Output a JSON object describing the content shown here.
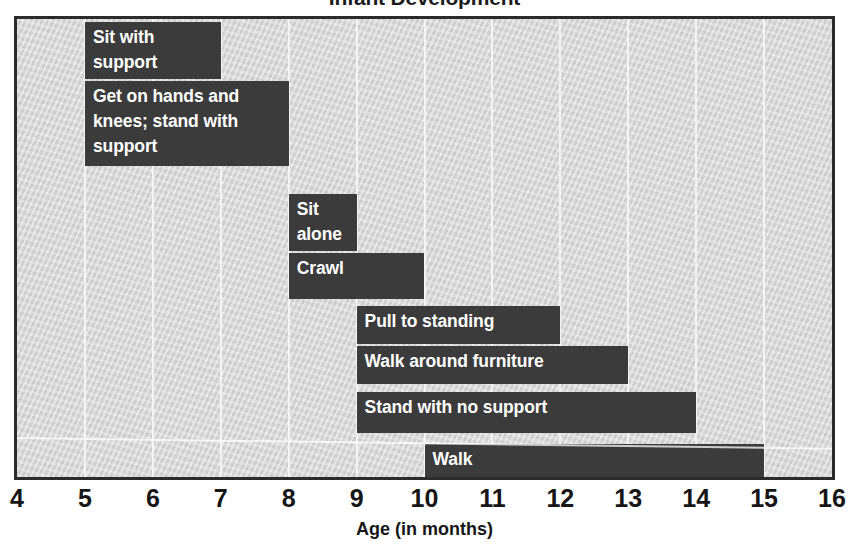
{
  "chart_data": {
    "type": "bar",
    "orientation": "horizontal",
    "subtype": "gantt-range",
    "title": "Infant Development",
    "xlabel": "Age (in months)",
    "ylabel": "",
    "xlim": [
      4,
      16
    ],
    "xticks": [
      4,
      5,
      6,
      7,
      8,
      9,
      10,
      11,
      12,
      13,
      14,
      15,
      16
    ],
    "xtick_labels": [
      "4",
      "5",
      "6",
      "7",
      "8",
      "9",
      "10",
      "11",
      "12",
      "13",
      "14",
      "15",
      "16"
    ],
    "grid": true,
    "grid_axis": "x",
    "legend": false,
    "categories": [
      "Sit with support",
      "Get on hands and knees; stand with support",
      "Sit alone",
      "Crawl",
      "Pull to standing",
      "Walk around furniture",
      "Stand with no support",
      "Walk"
    ],
    "bars": [
      {
        "label": "Sit with\nsupport",
        "label_plain": "Sit with support",
        "start": 5,
        "end": 7,
        "row": 0
      },
      {
        "label": "Get on hands and\nknees; stand with\nsupport",
        "label_plain": "Get on hands and knees; stand with support",
        "start": 5,
        "end": 8,
        "row": 1
      },
      {
        "label": "Sit\nalone",
        "label_plain": "Sit alone",
        "start": 8,
        "end": 9,
        "row": 2
      },
      {
        "label": "Crawl",
        "label_plain": "Crawl",
        "start": 8,
        "end": 10,
        "row": 3
      },
      {
        "label": "Pull to standing",
        "label_plain": "Pull to standing",
        "start": 9,
        "end": 12,
        "row": 4
      },
      {
        "label": "Walk around furniture",
        "label_plain": "Walk around furniture",
        "start": 9,
        "end": 13,
        "row": 5
      },
      {
        "label": "Stand with no support",
        "label_plain": "Stand with no support",
        "start": 9,
        "end": 14,
        "row": 6
      },
      {
        "label": "Walk",
        "label_plain": "Walk",
        "start": 10,
        "end": 15,
        "row": 7
      }
    ],
    "colors": {
      "bar": "#3b3b3b",
      "bar_text": "#ffffff",
      "plot_background": "#d5d5d5",
      "gridline": "#f4f4f4",
      "frame": "#2b2b2b",
      "axis_text": "#161616",
      "page_background": "#ffffff"
    }
  },
  "layout": {
    "plot": {
      "left": 14,
      "top": 16,
      "width": 821,
      "height": 464,
      "border": 3
    },
    "rows": [
      {
        "top": 3,
        "height": 57
      },
      {
        "top": 62,
        "height": 85
      },
      {
        "top": 175,
        "height": 57
      },
      {
        "top": 234,
        "height": 46
      },
      {
        "top": 287,
        "height": 38
      },
      {
        "top": 327,
        "height": 38
      },
      {
        "top": 373,
        "height": 41
      },
      {
        "top": 425,
        "height": 38
      }
    ]
  }
}
